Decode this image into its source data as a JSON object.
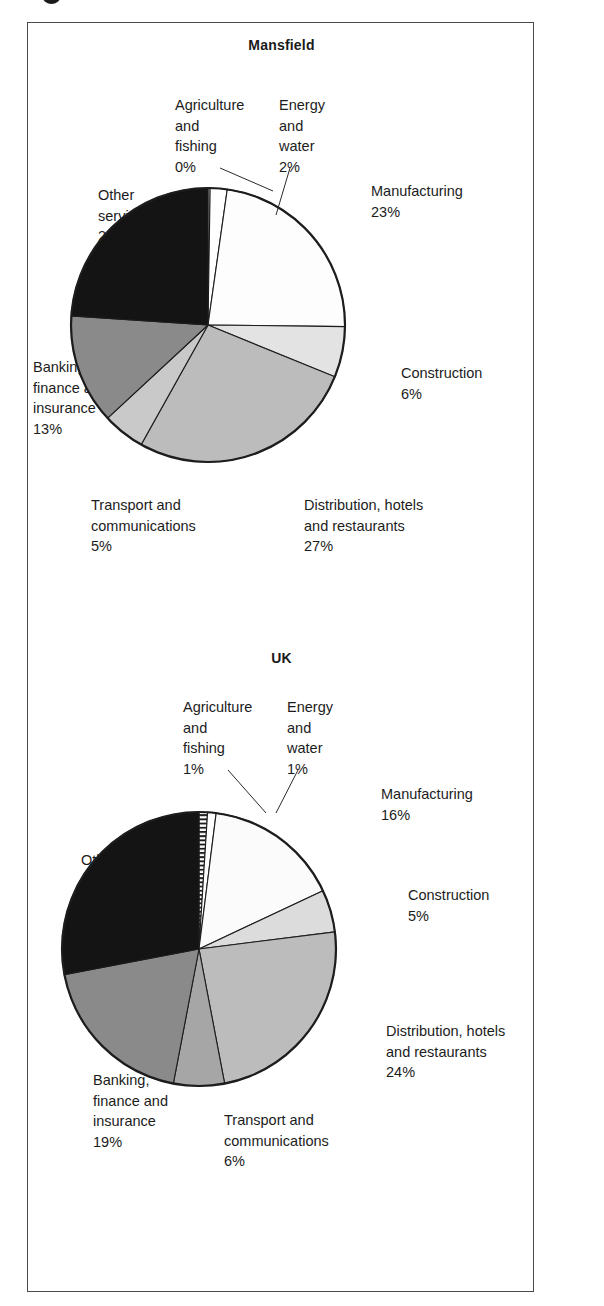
{
  "figure": {
    "charts": [
      {
        "id": "mansfield",
        "title": "Mansfield",
        "slices": [
          {
            "label": "Agriculture\nand\nfishing",
            "value": 0,
            "value_label": "0%",
            "fill": "#ffffff"
          },
          {
            "label": "Energy\nand\nwater",
            "value": 2,
            "value_label": "2%",
            "fill": "#ffffff"
          },
          {
            "label": "Manufacturing",
            "value": 23,
            "value_label": "23%",
            "fill": "#fdfdfd"
          },
          {
            "label": "Construction",
            "value": 6,
            "value_label": "6%",
            "fill": "#e3e3e3"
          },
          {
            "label": "Distribution, hotels\nand restaurants",
            "value": 27,
            "value_label": "27%",
            "fill": "#bcbcbc"
          },
          {
            "label": "Transport and\ncommunications",
            "value": 5,
            "value_label": "5%",
            "fill": "#c9c9c9"
          },
          {
            "label": "Banking,\nfinance and\ninsurance",
            "value": 13,
            "value_label": "13%",
            "fill": "#8a8a8a"
          },
          {
            "label": "Other\nservices",
            "value": 24,
            "value_label": "24%",
            "fill": "#141414"
          }
        ]
      },
      {
        "id": "uk",
        "title": "UK",
        "slices": [
          {
            "label": "Agriculture\nand\nfishing",
            "value": 1,
            "value_label": "1%",
            "fill": "url(#hatch)"
          },
          {
            "label": "Energy\nand\nwater",
            "value": 1,
            "value_label": "1%",
            "fill": "#ffffff"
          },
          {
            "label": "Manufacturing",
            "value": 16,
            "value_label": "16%",
            "fill": "#fbfbfb"
          },
          {
            "label": "Construction",
            "value": 5,
            "value_label": "5%",
            "fill": "#dcdcdc"
          },
          {
            "label": "Distribution, hotels\nand restaurants",
            "value": 24,
            "value_label": "24%",
            "fill": "#bcbcbc"
          },
          {
            "label": "Transport and\ncommunications",
            "value": 6,
            "value_label": "6%",
            "fill": "#a6a6a6"
          },
          {
            "label": "Banking,\nfinance and\ninsurance",
            "value": 19,
            "value_label": "19%",
            "fill": "#8a8a8a"
          },
          {
            "label": "Other\nservices",
            "value": 28,
            "value_label": "28%",
            "fill": "#141414"
          }
        ]
      }
    ]
  },
  "mansfield_labels": {
    "agriculture": "Agriculture\nand\nfishing\n0%",
    "energy": "Energy\nand\nwater\n2%",
    "manufacturing": "Manufacturing\n23%",
    "construction": "Construction\n6%",
    "distribution": "Distribution, hotels\nand restaurants\n27%",
    "transport": "Transport and\ncommunications\n5%",
    "banking": "Banking,\nfinance and\ninsurance\n13%",
    "other": "Other\nservices\n24%"
  },
  "uk_labels": {
    "agriculture": "Agriculture\nand\nfishing\n1%",
    "energy": "Energy\nand\nwater\n1%",
    "manufacturing": "Manufacturing\n16%",
    "construction": "Construction\n5%",
    "distribution": "Distribution, hotels\nand restaurants\n24%",
    "transport": "Transport and\ncommunications\n6%",
    "banking": "Banking,\nfinance and\ninsurance\n19%",
    "other": "Other\nservices\n28%"
  },
  "chart_data": [
    {
      "type": "pie",
      "title": "Mansfield",
      "categories": [
        "Agriculture and fishing",
        "Energy and water",
        "Manufacturing",
        "Construction",
        "Distribution, hotels and restaurants",
        "Transport and communications",
        "Banking, finance and insurance",
        "Other services"
      ],
      "values": [
        0,
        2,
        23,
        6,
        27,
        5,
        13,
        24
      ],
      "value_labels": [
        "0%",
        "2%",
        "23%",
        "6%",
        "27%",
        "5%",
        "13%",
        "24%"
      ],
      "units": "percent",
      "start_angle_deg": 0,
      "direction": "clockwise",
      "legend": "none (labels with leader lines around pie)",
      "grid": false,
      "xlabel": "",
      "ylabel": ""
    },
    {
      "type": "pie",
      "title": "UK",
      "categories": [
        "Agriculture and fishing",
        "Energy and water",
        "Manufacturing",
        "Construction",
        "Distribution, hotels and restaurants",
        "Transport and communications",
        "Banking, finance and insurance",
        "Other services"
      ],
      "values": [
        1,
        1,
        16,
        5,
        24,
        6,
        19,
        28
      ],
      "value_labels": [
        "1%",
        "1%",
        "16%",
        "5%",
        "24%",
        "6%",
        "19%",
        "28%"
      ],
      "units": "percent",
      "start_angle_deg": 0,
      "direction": "clockwise",
      "legend": "none (labels with leader lines around pie)",
      "grid": false,
      "xlabel": "",
      "ylabel": ""
    }
  ],
  "colors": {
    "frame": "#4a4a4a",
    "text": "#1c1c1c",
    "slice_black": "#141414",
    "slice_dark_gray": "#8a8a8a",
    "slice_mid_gray": "#bcbcbc",
    "slice_light_gray": "#dcdcdc",
    "slice_white": "#ffffff"
  }
}
